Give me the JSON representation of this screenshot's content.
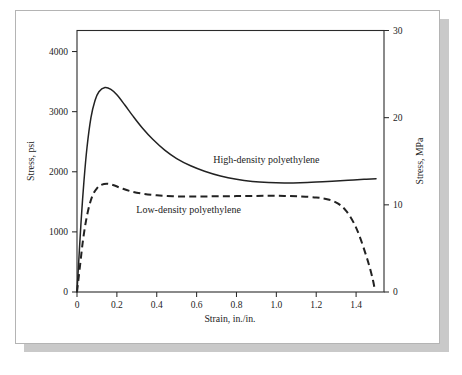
{
  "figure": {
    "background_color": "#ffffff",
    "panel_border_color": "#b4b4b4",
    "shadow_color": "#c9c9c9",
    "ink_color": "#232323"
  },
  "chart_data": {
    "type": "line",
    "title": "",
    "subtitle": "",
    "xlabel": "Strain, in./in.",
    "ylabel": "Stress, psi",
    "y2label": "Stress, MPa",
    "xlim": [
      0,
      1.54
    ],
    "ylim": [
      0,
      4350
    ],
    "y2lim": [
      0,
      30
    ],
    "grid": false,
    "legend_position": "inline-annotations",
    "xticks": [
      0,
      0.2,
      0.4,
      0.6,
      0.8,
      1.0,
      1.2,
      1.4
    ],
    "xticklabels": [
      "0",
      "0.2",
      "0.4",
      "0.6",
      "0.8",
      "1.0",
      "1.2",
      "1.4"
    ],
    "yticks": [
      0,
      1000,
      2000,
      3000,
      4000
    ],
    "yticklabels": [
      "0",
      "1000",
      "2000",
      "3000",
      "4000"
    ],
    "y2ticks": [
      0,
      10,
      20,
      30
    ],
    "y2ticklabels": [
      "0",
      "10",
      "20",
      "30"
    ],
    "annotations": [
      {
        "text": "High-density polyethylene",
        "x": 0.95,
        "y": 2150
      },
      {
        "text": "Low-density polyethylene",
        "x": 0.56,
        "y": 1320
      }
    ],
    "series": [
      {
        "name": "High-density polyethylene",
        "style": "solid",
        "x": [
          0,
          0.005,
          0.012,
          0.022,
          0.035,
          0.05,
          0.07,
          0.09,
          0.11,
          0.14,
          0.17,
          0.2,
          0.24,
          0.28,
          0.33,
          0.38,
          0.44,
          0.5,
          0.57,
          0.64,
          0.72,
          0.8,
          0.88,
          0.96,
          1.04,
          1.12,
          1.2,
          1.28,
          1.36,
          1.44,
          1.5
        ],
        "y": [
          0,
          300,
          700,
          1250,
          1850,
          2400,
          2900,
          3180,
          3330,
          3400,
          3370,
          3280,
          3110,
          2930,
          2720,
          2540,
          2360,
          2220,
          2100,
          2010,
          1930,
          1875,
          1840,
          1822,
          1815,
          1818,
          1828,
          1842,
          1858,
          1875,
          1885
        ]
      },
      {
        "name": "Low-density polyethylene",
        "style": "dashed",
        "x": [
          0,
          0.008,
          0.018,
          0.03,
          0.045,
          0.062,
          0.08,
          0.1,
          0.12,
          0.15,
          0.18,
          0.22,
          0.27,
          0.33,
          0.4,
          0.48,
          0.56,
          0.64,
          0.72,
          0.8,
          0.88,
          0.96,
          1.04,
          1.12,
          1.2,
          1.26,
          1.31,
          1.35,
          1.39,
          1.42,
          1.45,
          1.47,
          1.485,
          1.495
        ],
        "y": [
          0,
          230,
          520,
          860,
          1180,
          1440,
          1620,
          1725,
          1780,
          1800,
          1780,
          1730,
          1675,
          1635,
          1608,
          1592,
          1588,
          1590,
          1592,
          1595,
          1598,
          1600,
          1598,
          1590,
          1572,
          1540,
          1470,
          1350,
          1140,
          905,
          610,
          390,
          190,
          20
        ]
      }
    ]
  }
}
